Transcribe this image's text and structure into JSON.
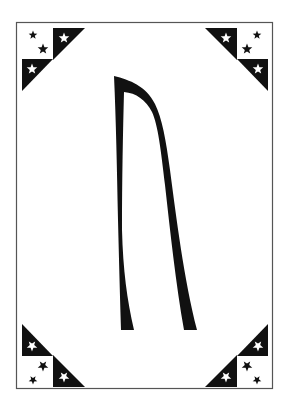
{
  "card": {
    "type": "decorative-rune-card",
    "glyph": "ᚢ",
    "glyph_name": "uruz-rune",
    "colors": {
      "background": "#ffffff",
      "ink": "#111111",
      "border": "#555555"
    },
    "corners": [
      {
        "position": "top-left",
        "icon": "star-triangle-ornament",
        "stars": 4
      },
      {
        "position": "top-right",
        "icon": "star-triangle-ornament",
        "stars": 4
      },
      {
        "position": "bottom-left",
        "icon": "star-triangle-ornament",
        "stars": 4
      },
      {
        "position": "bottom-right",
        "icon": "star-triangle-ornament",
        "stars": 4
      }
    ]
  }
}
